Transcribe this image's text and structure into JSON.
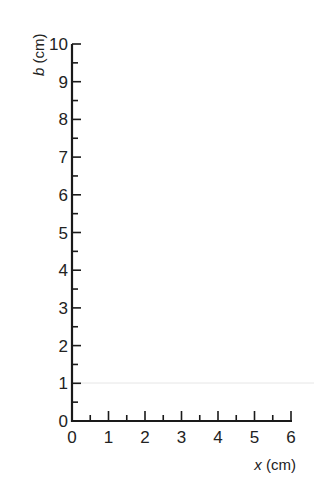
{
  "chart_data": {
    "type": "line",
    "title": "",
    "xlabel_var": "x",
    "xlabel_unit": " (cm)",
    "ylabel_var": "b",
    "ylabel_unit": " (cm)",
    "xlim": [
      0,
      6
    ],
    "ylim": [
      0,
      10
    ],
    "x_ticks": [
      "0",
      "1",
      "2",
      "3",
      "4",
      "5",
      "6"
    ],
    "y_ticks": [
      "0",
      "1",
      "2",
      "3",
      "4",
      "5",
      "6",
      "7",
      "8",
      "9",
      "10"
    ],
    "minor_ticks": "half-unit on both axes",
    "grid": false,
    "series": []
  }
}
